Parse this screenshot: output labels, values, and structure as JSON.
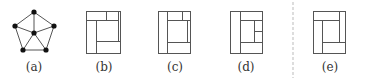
{
  "colors": {
    "stroke": "#555555",
    "node": "#111111",
    "divider": "#bbbbbb",
    "label": "#333333"
  },
  "labels": [
    {
      "id": "a",
      "text": "(a)",
      "x": 34
    },
    {
      "id": "b",
      "text": "(b)",
      "x": 104
    },
    {
      "id": "c",
      "text": "(c)",
      "x": 175
    },
    {
      "id": "d",
      "text": "(d)",
      "x": 246
    },
    {
      "id": "e",
      "text": "(e)",
      "x": 330
    }
  ],
  "graph_a": {
    "nodes": [
      {
        "id": "top",
        "x": 34,
        "y": 12
      },
      {
        "id": "left",
        "x": 15,
        "y": 26
      },
      {
        "id": "right",
        "x": 54,
        "y": 26
      },
      {
        "id": "center",
        "x": 34,
        "y": 33
      },
      {
        "id": "bl",
        "x": 23,
        "y": 50
      },
      {
        "id": "br",
        "x": 46,
        "y": 50
      }
    ],
    "edges": [
      [
        "top",
        "left"
      ],
      [
        "top",
        "right"
      ],
      [
        "left",
        "bl"
      ],
      [
        "right",
        "br"
      ],
      [
        "bl",
        "br"
      ],
      [
        "center",
        "top"
      ],
      [
        "center",
        "left"
      ],
      [
        "center",
        "right"
      ],
      [
        "center",
        "bl"
      ],
      [
        "center",
        "br"
      ]
    ]
  },
  "dissections": [
    {
      "id": "b",
      "box": {
        "x": 86,
        "y": 11,
        "w": 34,
        "h": 42
      },
      "lines": [
        [
          86,
          20,
          118,
          20
        ],
        [
          106,
          11,
          106,
          20
        ],
        [
          96,
          20,
          96,
          53
        ],
        [
          118,
          11,
          118,
          41
        ],
        [
          96,
          41,
          120,
          41
        ]
      ]
    },
    {
      "id": "c",
      "box": {
        "x": 158,
        "y": 11,
        "w": 32,
        "h": 42
      },
      "lines": [
        [
          167,
          11,
          167,
          53
        ],
        [
          167,
          20,
          190,
          20
        ],
        [
          182,
          11,
          182,
          20
        ],
        [
          187,
          20,
          187,
          42
        ],
        [
          167,
          42,
          190,
          42
        ]
      ]
    },
    {
      "id": "d",
      "box": {
        "x": 230,
        "y": 11,
        "w": 32,
        "h": 42
      },
      "lines": [
        [
          240,
          11,
          240,
          53
        ],
        [
          240,
          20,
          262,
          20
        ],
        [
          254,
          20,
          254,
          42
        ],
        [
          254,
          31,
          262,
          31
        ],
        [
          240,
          42,
          262,
          42
        ]
      ]
    },
    {
      "id": "e",
      "box": {
        "x": 313,
        "y": 11,
        "w": 32,
        "h": 42
      },
      "lines": [
        [
          313,
          20,
          339,
          20
        ],
        [
          339,
          11,
          339,
          42
        ],
        [
          322,
          20,
          322,
          53
        ],
        [
          322,
          42,
          345,
          42
        ]
      ]
    }
  ],
  "divider": {
    "x": 293,
    "y1": 2,
    "y2": 78
  }
}
